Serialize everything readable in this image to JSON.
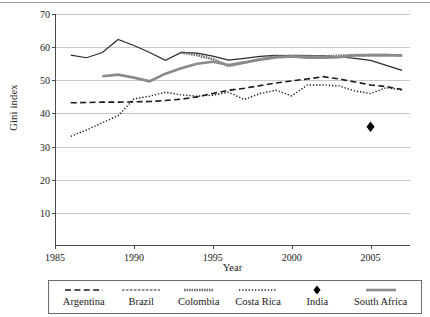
{
  "figure": {
    "ylabel": "Gini index",
    "xlabel": "Year"
  },
  "legend": {
    "items": [
      {
        "label": "Argentina",
        "style": "dashed",
        "color": "#1a1a1a"
      },
      {
        "label": "Brazil",
        "style": "short-dash",
        "color": "#2b2b2b"
      },
      {
        "label": "Colombia",
        "style": "thick-gray",
        "color": "#6e6e6e"
      },
      {
        "label": "Costa Rica",
        "style": "dotted",
        "color": "#1a1a1a"
      },
      {
        "label": "India",
        "style": "marker",
        "color": "#000000"
      },
      {
        "label": "South Africa",
        "style": "thick-gray2",
        "color": "#8a8a8a"
      }
    ]
  },
  "chart_data": {
    "type": "line",
    "title": "",
    "xlabel": "Year",
    "ylabel": "Gini index",
    "xlim": [
      1985,
      2007.5
    ],
    "ylim": [
      0,
      70
    ],
    "yticks": [
      10,
      20,
      30,
      40,
      50,
      60,
      70
    ],
    "xticks": [
      1985,
      1990,
      1995,
      2000,
      2005
    ],
    "grid": "horizontal",
    "legend_position": "bottom",
    "series": [
      {
        "name": "Argentina",
        "style": "dashed",
        "color": "#1a1a1a",
        "points": [
          [
            1986,
            43.2
          ],
          [
            1987,
            43.3
          ],
          [
            1988,
            43.4
          ],
          [
            1989,
            43.4
          ],
          [
            1990,
            43.5
          ],
          [
            1991,
            43.6
          ],
          [
            1992,
            43.9
          ],
          [
            1993,
            44.3
          ],
          [
            1994,
            45.0
          ],
          [
            1995,
            46.0
          ],
          [
            1996,
            47.0
          ],
          [
            1997,
            47.6
          ],
          [
            1998,
            48.4
          ],
          [
            1999,
            49.2
          ],
          [
            2000,
            49.8
          ],
          [
            2001,
            50.4
          ],
          [
            2002,
            51.1
          ],
          [
            2003,
            50.4
          ],
          [
            2004,
            49.5
          ],
          [
            2005,
            48.6
          ],
          [
            2006,
            48.1
          ],
          [
            2007,
            47.2
          ]
        ]
      },
      {
        "name": "Brazil",
        "style": "short-dash",
        "color": "#2b2b2b",
        "points": [
          [
            1986,
            57.6
          ],
          [
            1987,
            56.8
          ],
          [
            1988,
            58.4
          ],
          [
            1989,
            62.3
          ],
          [
            1990,
            60.5
          ],
          [
            1991,
            58.4
          ],
          [
            1992,
            56.0
          ],
          [
            1993,
            58.4
          ],
          [
            1994,
            58.2
          ],
          [
            1995,
            57.3
          ],
          [
            1996,
            56.1
          ],
          [
            1997,
            56.6
          ],
          [
            1998,
            57.2
          ],
          [
            1999,
            57.5
          ],
          [
            2000,
            57.4
          ],
          [
            2001,
            57.4
          ],
          [
            2002,
            57.4
          ],
          [
            2003,
            57.1
          ],
          [
            2004,
            56.6
          ],
          [
            2005,
            56.0
          ],
          [
            2006,
            54.5
          ],
          [
            2007,
            53.0
          ]
        ]
      },
      {
        "name": "Colombia",
        "style": "thick-gray",
        "color": "#6e6e6e",
        "points": [
          [
            1993,
            58.4
          ],
          [
            1994,
            57.6
          ],
          [
            1995,
            56.4
          ],
          [
            1996,
            54.3
          ],
          [
            1997,
            55.3
          ],
          [
            1998,
            56.4
          ],
          [
            1999,
            57.2
          ],
          [
            2000,
            57.4
          ],
          [
            2001,
            57.3
          ],
          [
            2002,
            57.2
          ],
          [
            2003,
            57.4
          ],
          [
            2004,
            57.6
          ],
          [
            2005,
            57.6
          ],
          [
            2006,
            57.6
          ],
          [
            2007,
            57.5
          ]
        ]
      },
      {
        "name": "Costa Rica",
        "style": "dotted",
        "color": "#1a1a1a",
        "points": [
          [
            1986,
            33.1
          ],
          [
            1987,
            35.0
          ],
          [
            1988,
            37.2
          ],
          [
            1989,
            39.3
          ],
          [
            1990,
            44.4
          ],
          [
            1991,
            45.2
          ],
          [
            1992,
            46.4
          ],
          [
            1993,
            45.6
          ],
          [
            1994,
            45.2
          ],
          [
            1995,
            45.5
          ],
          [
            1996,
            46.4
          ],
          [
            1997,
            44.2
          ],
          [
            1998,
            46.0
          ],
          [
            1999,
            47.0
          ],
          [
            2000,
            45.3
          ],
          [
            2001,
            48.6
          ],
          [
            2002,
            48.6
          ],
          [
            2003,
            48.3
          ],
          [
            2004,
            46.8
          ],
          [
            2005,
            46.0
          ],
          [
            2006,
            47.8
          ],
          [
            2007,
            47.0
          ]
        ]
      },
      {
        "name": "South Africa",
        "style": "thick-gray2",
        "color": "#8a8a8a",
        "points": [
          [
            1988,
            51.2
          ],
          [
            1989,
            51.7
          ],
          [
            1990,
            50.8
          ],
          [
            1991,
            49.7
          ],
          [
            1992,
            52.0
          ],
          [
            1993,
            53.6
          ],
          [
            1994,
            55.0
          ],
          [
            1995,
            55.6
          ],
          [
            1996,
            54.6
          ],
          [
            1997,
            55.4
          ],
          [
            1998,
            56.2
          ],
          [
            1999,
            56.9
          ],
          [
            2000,
            57.2
          ],
          [
            2001,
            56.8
          ],
          [
            2002,
            56.8
          ],
          [
            2003,
            57.0
          ],
          [
            2004,
            57.5
          ],
          [
            2005,
            57.6
          ],
          [
            2006,
            57.6
          ],
          [
            2007,
            57.5
          ]
        ]
      },
      {
        "name": "India",
        "style": "marker",
        "color": "#000000",
        "points": [
          [
            2005,
            36.0
          ]
        ]
      }
    ]
  }
}
